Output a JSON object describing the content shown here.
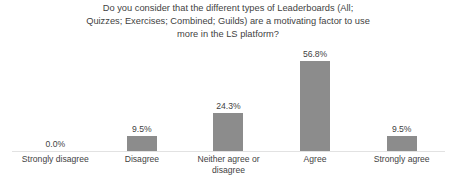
{
  "chart_data": {
    "type": "bar",
    "title": "Do you consider that the different types of Leaderboards (All; Quizzes; Exercises; Combined; Guilds) are a motivating factor to use more in the LS platform?",
    "title_lines": [
      "Do you consider that the different types of Leaderboards (All;",
      "Quizzes; Exercises; Combined; Guilds) are a motivating factor to use",
      "more in the LS platform?"
    ],
    "categories": [
      "Strongly disagree",
      "Disagree",
      "Neither agree or disagree",
      "Agree",
      "Strongly agree"
    ],
    "values": [
      0.0,
      9.5,
      24.3,
      56.8,
      9.5
    ],
    "data_labels": [
      "0.0%",
      "9.5%",
      "24.3%",
      "56.8%",
      "9.5%"
    ],
    "xlabel": "",
    "ylabel": "",
    "ylim": [
      0,
      60
    ],
    "grid": false,
    "legend": false,
    "bar_color": "#8c8c8c",
    "text_color": "#3f3f3f",
    "axis_color": "#e2e2e2",
    "background": "#ffffff"
  }
}
